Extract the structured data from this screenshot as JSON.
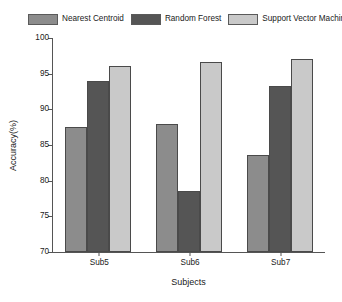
{
  "chart_data": {
    "type": "bar",
    "title": "",
    "xlabel": "Subjects",
    "ylabel": "Accuracy(%)",
    "categories": [
      "Sub5",
      "Sub6",
      "Sub7"
    ],
    "series": [
      {
        "name": "Nearest Centroid",
        "color": "#8c8c8c",
        "values": [
          87.5,
          88.0,
          83.6
        ]
      },
      {
        "name": "Random Forest",
        "color": "#555555",
        "values": [
          94.0,
          78.5,
          93.3
        ]
      },
      {
        "name": "Support Vector Machine",
        "color": "#c9c9c9",
        "values": [
          96.1,
          96.7,
          97.0
        ]
      }
    ],
    "ylim": [
      70,
      100
    ],
    "yticks": [
      70,
      75,
      80,
      85,
      90,
      95,
      100
    ],
    "ytick_labels": [
      "70",
      "75",
      "80",
      "85",
      "90",
      "95",
      "100"
    ],
    "grid": false,
    "legend_position": "top"
  }
}
